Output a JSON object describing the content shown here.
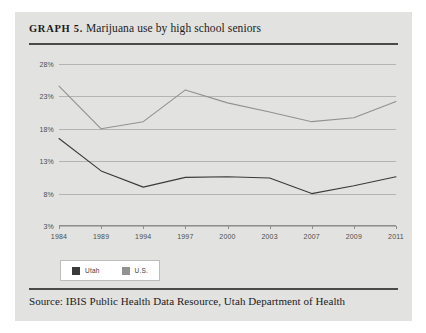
{
  "figure": {
    "label": "GRAPH 5.",
    "title": "Marijuana use by high school seniors",
    "source": "Source: IBIS Public Health Data Resource, Utah Department of Health"
  },
  "legend": {
    "items": [
      {
        "label": "Utah",
        "color": "#3a3a3a"
      },
      {
        "label": "U.S.",
        "color": "#919190"
      }
    ]
  },
  "chart_data": {
    "type": "line",
    "title": "Marijuana use by high school seniors",
    "xlabel": "",
    "ylabel": "",
    "categories": [
      "1984",
      "1989",
      "1994",
      "1997",
      "2000",
      "2003",
      "2007",
      "2009",
      "2011"
    ],
    "yticks": [
      "3%",
      "8%",
      "13%",
      "18%",
      "23%",
      "28%"
    ],
    "ytick_values": [
      3,
      8,
      13,
      18,
      23,
      28
    ],
    "ylim": [
      3,
      28
    ],
    "grid": true,
    "legend_position": "bottom-left",
    "series": [
      {
        "name": "Utah",
        "color": "#3a3a3a",
        "values": [
          16.5,
          11.5,
          9.0,
          10.5,
          10.6,
          10.4,
          8.0,
          9.2,
          10.6
        ]
      },
      {
        "name": "U.S.",
        "color": "#919190",
        "values": [
          24.6,
          18.0,
          19.1,
          24.0,
          22.0,
          20.6,
          19.1,
          19.7,
          22.2
        ]
      }
    ]
  }
}
